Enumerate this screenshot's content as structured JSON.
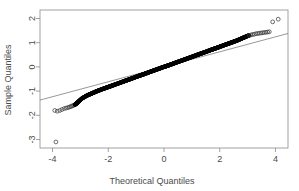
{
  "chart_data": {
    "type": "scatter",
    "title": "",
    "subtitle": "",
    "xlabel": "Theoretical Quantiles",
    "ylabel": "Sample Quantiles",
    "xlim": [
      -4.45,
      4.45
    ],
    "ylim": [
      -3.35,
      2.35
    ],
    "xticks": [
      -4,
      -2,
      0,
      2,
      4
    ],
    "xticklabels": [
      "-4",
      "-2",
      "0",
      "2",
      "4"
    ],
    "yticks": [
      2,
      1,
      0,
      -1,
      -2,
      -3
    ],
    "yticklabels": [
      "2",
      "1",
      "0",
      "-1",
      "-2",
      "-3"
    ],
    "grid": false,
    "legend": null,
    "point_style": "open-circle",
    "reference_line": {
      "label": "qq-line",
      "x0": -4.45,
      "y0": -1.37,
      "x1": 4.45,
      "y1": 1.38,
      "slope": 0.309,
      "intercept": 0.0
    },
    "series": [
      {
        "name": "Sample quantiles",
        "x": [
          -3.92,
          -3.83,
          -3.74,
          -3.66,
          -3.58,
          -3.51,
          -3.45,
          -3.4,
          -3.35,
          -3.31,
          -3.27,
          -3.23,
          -3.19,
          -3.15,
          -3.11,
          -3.06,
          -3.0,
          -2.94,
          -2.88,
          -2.82,
          -2.76,
          -2.7,
          -2.64,
          -2.58,
          -2.52,
          -2.46,
          -2.4,
          -2.34,
          -2.28,
          -2.22,
          -2.16,
          -2.1,
          -2.04,
          -1.98,
          -1.92,
          -1.86,
          -1.8,
          -1.74,
          -1.68,
          -1.62,
          -1.56,
          -1.5,
          -1.44,
          -1.38,
          -1.32,
          -1.26,
          -1.2,
          -1.14,
          -1.08,
          -1.02,
          -0.96,
          -0.9,
          -0.84,
          -0.78,
          -0.72,
          -0.66,
          -0.6,
          -0.54,
          -0.48,
          -0.42,
          -0.36,
          -0.3,
          -0.24,
          -0.18,
          -0.12,
          -0.06,
          0.0,
          0.06,
          0.12,
          0.18,
          0.24,
          0.3,
          0.36,
          0.42,
          0.48,
          0.54,
          0.6,
          0.66,
          0.72,
          0.78,
          0.84,
          0.9,
          0.96,
          1.02,
          1.08,
          1.14,
          1.2,
          1.26,
          1.32,
          1.38,
          1.44,
          1.5,
          1.56,
          1.62,
          1.68,
          1.74,
          1.8,
          1.86,
          1.92,
          1.98,
          2.04,
          2.1,
          2.16,
          2.22,
          2.28,
          2.34,
          2.4,
          2.46,
          2.52,
          2.58,
          2.64,
          2.7,
          2.76,
          2.82,
          2.88,
          2.94,
          3.0,
          3.06,
          3.12,
          3.18,
          3.24,
          3.3,
          3.36,
          3.42,
          3.48,
          3.54,
          3.6,
          3.66,
          3.72,
          3.78,
          3.9,
          4.1,
          -3.88
        ],
        "y": [
          -1.8,
          -1.83,
          -1.8,
          -1.76,
          -1.72,
          -1.7,
          -1.68,
          -1.66,
          -1.64,
          -1.62,
          -1.6,
          -1.58,
          -1.56,
          -1.52,
          -1.48,
          -1.42,
          -1.36,
          -1.3,
          -1.26,
          -1.22,
          -1.18,
          -1.15,
          -1.12,
          -1.09,
          -1.06,
          -1.03,
          -1.0,
          -0.97,
          -0.95,
          -0.92,
          -0.9,
          -0.87,
          -0.85,
          -0.82,
          -0.8,
          -0.77,
          -0.75,
          -0.72,
          -0.7,
          -0.67,
          -0.65,
          -0.62,
          -0.6,
          -0.57,
          -0.55,
          -0.52,
          -0.5,
          -0.47,
          -0.45,
          -0.42,
          -0.4,
          -0.37,
          -0.35,
          -0.32,
          -0.3,
          -0.27,
          -0.25,
          -0.22,
          -0.2,
          -0.17,
          -0.15,
          -0.12,
          -0.1,
          -0.07,
          -0.05,
          -0.02,
          0.0,
          0.02,
          0.05,
          0.07,
          0.1,
          0.12,
          0.15,
          0.17,
          0.2,
          0.22,
          0.25,
          0.27,
          0.3,
          0.32,
          0.35,
          0.37,
          0.4,
          0.42,
          0.45,
          0.47,
          0.5,
          0.52,
          0.55,
          0.57,
          0.6,
          0.62,
          0.65,
          0.67,
          0.7,
          0.72,
          0.75,
          0.77,
          0.8,
          0.82,
          0.85,
          0.87,
          0.9,
          0.92,
          0.95,
          0.97,
          1.0,
          1.02,
          1.05,
          1.07,
          1.1,
          1.13,
          1.16,
          1.19,
          1.22,
          1.25,
          1.28,
          1.3,
          1.32,
          1.34,
          1.35,
          1.37,
          1.38,
          1.39,
          1.4,
          1.41,
          1.42,
          1.43,
          1.44,
          1.45,
          1.86,
          1.97,
          -3.1
        ],
        "dense_range": [
          -3.2,
          3.0
        ],
        "outliers": [
          {
            "x": -3.88,
            "y": -3.1,
            "note": "low outlier"
          },
          {
            "x": 3.9,
            "y": 1.86,
            "note": "high outlier"
          },
          {
            "x": 4.1,
            "y": 1.97,
            "note": "high outlier"
          }
        ]
      }
    ]
  },
  "plot": {
    "xlabel": "Theoretical Quantiles",
    "ylabel": "Sample Quantiles",
    "xticklabels": [
      "-4",
      "-2",
      "0",
      "2",
      "4"
    ],
    "yticklabels": [
      "2",
      "1",
      "0",
      "-1",
      "-2",
      "-3"
    ]
  },
  "colors": {
    "point": "#000000",
    "outline": "#3c3c3c",
    "axis": "#8a8a8a",
    "text": "#4a4a4a",
    "reference_line": "#6b6b6b",
    "background": "#ffffff"
  }
}
